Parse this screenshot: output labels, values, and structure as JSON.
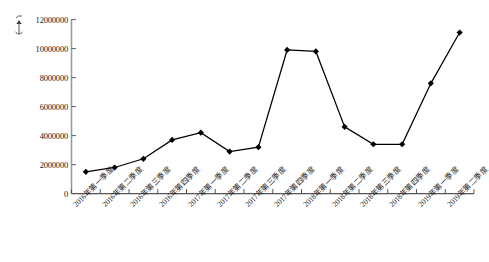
{
  "chart_data": {
    "type": "line",
    "title": "",
    "xlabel": "",
    "ylabel": "",
    "unit_symbol": "(个)",
    "ylim": [
      0,
      12000000
    ],
    "ytick_step": 2000000,
    "grid": false,
    "legend": "none",
    "marker": "diamond",
    "line_color": "#000000",
    "marker_color": "#000000",
    "axis_color": "#808080",
    "yticks": [
      "0",
      "2000000",
      "4000000",
      "6000000",
      "8000000",
      "10000000",
      "12000000"
    ],
    "categories": [
      "2016年第一季度",
      "2016年第二季度",
      "2016年第三季度",
      "2016年第四季度",
      "2017年第一季度",
      "2017年第二季度",
      "2017年第三季度",
      "2017年第四季度",
      "2018年第一季度",
      "2018年第二季度",
      "2018年第三季度",
      "2018年第四季度",
      "2019年第一季度",
      "2019年第二季度"
    ],
    "values": [
      1500000,
      1800000,
      2400000,
      3700000,
      4200000,
      2900000,
      3200000,
      9900000,
      9800000,
      4600000,
      3400000,
      3400000,
      7600000,
      11100000
    ]
  }
}
